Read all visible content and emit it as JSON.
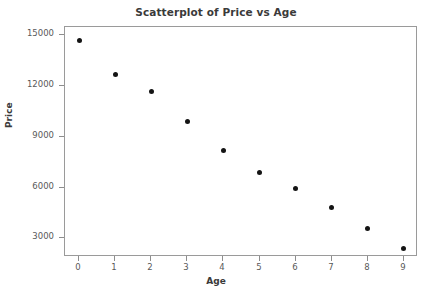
{
  "chart_data": {
    "type": "scatter",
    "title": "Scatterplot of Price vs Age",
    "xlabel": "Age",
    "ylabel": "Price",
    "x": [
      0,
      1,
      2,
      3,
      4,
      5,
      6,
      7,
      8,
      9
    ],
    "values": [
      14700,
      12650,
      11650,
      9900,
      8200,
      6900,
      5950,
      4850,
      3600,
      2400
    ],
    "series": [
      {
        "name": "Price",
        "x": [
          0,
          1,
          2,
          3,
          4,
          5,
          6,
          7,
          8,
          9
        ],
        "values": [
          14700,
          12650,
          11650,
          9900,
          8200,
          6900,
          5950,
          4850,
          3600,
          2400
        ]
      }
    ],
    "xticks": [
      "0",
      "1",
      "2",
      "3",
      "4",
      "5",
      "6",
      "7",
      "8",
      "9"
    ],
    "xtick_values": [
      0,
      1,
      2,
      3,
      4,
      5,
      6,
      7,
      8,
      9
    ],
    "yticks": [
      "3000",
      "6000",
      "9000",
      "12000",
      "15000"
    ],
    "ytick_values": [
      3000,
      6000,
      9000,
      12000,
      15000
    ],
    "xlim": [
      -0.4,
      9.4
    ],
    "ylim": [
      1900,
      15470
    ],
    "grid": false,
    "legend": false,
    "marker": "filled-circle",
    "marker_color": "#141414",
    "frame_color": "#9a9a9a",
    "background_color": "#ffffff"
  }
}
